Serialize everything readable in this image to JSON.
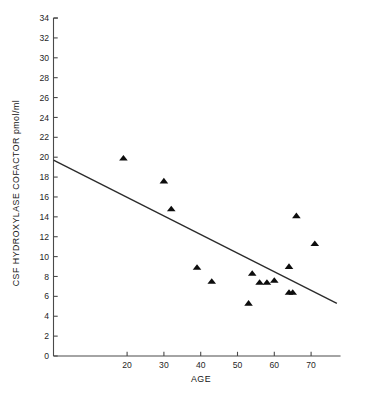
{
  "chart_data": {
    "type": "scatter",
    "title": "",
    "xlabel": "AGE",
    "ylabel": "CSF HYDROXYLASE COFACTOR pmol/ml",
    "xlim": [
      0,
      78
    ],
    "ylim": [
      0,
      34
    ],
    "grid": false,
    "legend": "none",
    "marker_shape": "triangle",
    "marker_color": "#0d0d0d",
    "line_color": "#2b2b2b",
    "xticks": [
      20,
      30,
      40,
      50,
      60,
      70
    ],
    "xtick_labels": [
      "20",
      "30",
      "40",
      "50",
      "60",
      "70"
    ],
    "yticks": [
      0,
      2,
      4,
      6,
      8,
      10,
      12,
      14,
      16,
      18,
      20,
      22,
      24,
      26,
      28,
      30,
      32,
      34
    ],
    "ytick_labels": [
      "0",
      "2",
      "4",
      "6",
      "8",
      "10",
      "12",
      "14",
      "16",
      "18",
      "20",
      "22",
      "24",
      "26",
      "28",
      "30",
      "32",
      "34"
    ],
    "points": [
      {
        "x": 19,
        "y": 19.9
      },
      {
        "x": 30,
        "y": 17.6
      },
      {
        "x": 32,
        "y": 14.8
      },
      {
        "x": 39,
        "y": 8.9
      },
      {
        "x": 43,
        "y": 7.5
      },
      {
        "x": 53,
        "y": 5.3
      },
      {
        "x": 54,
        "y": 8.3
      },
      {
        "x": 56,
        "y": 7.4
      },
      {
        "x": 58,
        "y": 7.4
      },
      {
        "x": 60,
        "y": 7.6
      },
      {
        "x": 64,
        "y": 6.4
      },
      {
        "x": 65,
        "y": 6.4
      },
      {
        "x": 64,
        "y": 9.0
      },
      {
        "x": 66,
        "y": 14.1
      },
      {
        "x": 71,
        "y": 11.3
      }
    ],
    "fit_line": {
      "label": "regression line",
      "x_start": 0,
      "y_start": 19.7,
      "x_end": 77,
      "y_end": 5.3
    }
  }
}
